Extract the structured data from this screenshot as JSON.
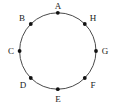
{
  "figure": {
    "type": "circle-with-labeled-points",
    "background_color": "#ffffff",
    "stroke_color": "#4a4a4a",
    "point_color": "#111111",
    "label_color": "#1a1a1a",
    "circle": {
      "center_x": 57.8,
      "center_y": 51.0,
      "radius": 38.2,
      "stroke_width": 1
    },
    "point_radius": 1.9,
    "points": [
      {
        "label": "A",
        "angle_deg": 90,
        "px": 57.8,
        "py": 12.8,
        "label_x": 58,
        "label_y": 6
      },
      {
        "label": "B",
        "angle_deg": 135,
        "px": 30.8,
        "py": 24.0,
        "label_x": 22,
        "label_y": 18
      },
      {
        "label": "C",
        "angle_deg": 180,
        "px": 19.6,
        "py": 51.0,
        "label_x": 11,
        "label_y": 51
      },
      {
        "label": "D",
        "angle_deg": 225,
        "px": 30.8,
        "py": 78.0,
        "label_x": 23,
        "label_y": 85
      },
      {
        "label": "E",
        "angle_deg": 270,
        "px": 57.8,
        "py": 89.2,
        "label_x": 58,
        "label_y": 99
      },
      {
        "label": "F",
        "angle_deg": 315,
        "px": 84.8,
        "py": 78.0,
        "label_x": 93,
        "label_y": 85
      },
      {
        "label": "G",
        "angle_deg": 0,
        "px": 96.0,
        "py": 51.0,
        "label_x": 105,
        "label_y": 51
      },
      {
        "label": "H",
        "angle_deg": 45,
        "px": 84.8,
        "py": 24.0,
        "label_x": 93,
        "label_y": 18
      }
    ]
  }
}
